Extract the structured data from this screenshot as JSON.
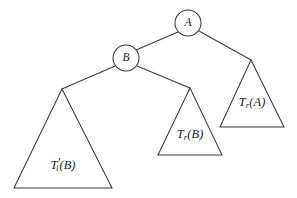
{
  "diagram": {
    "background_color": "#ffffff",
    "stroke_color": "#3a3a3a",
    "text_color": "#1c1c1c",
    "nodes": [
      {
        "id": "A",
        "label": "A",
        "cx": 188,
        "cy": 23,
        "r": 13
      },
      {
        "id": "B",
        "label": "B",
        "cx": 126,
        "cy": 58,
        "r": 13
      }
    ],
    "subtrees": [
      {
        "id": "Tl_prime_B",
        "label_main": "T",
        "label_sub": "l",
        "label_prime": "′",
        "label_arg": "(B)",
        "label_full": "T′ₗ(B)",
        "apex_x": 62,
        "apex_y": 89,
        "base_left_x": 14,
        "base_right_x": 112,
        "base_y": 188,
        "label_x": 63,
        "label_y": 166
      },
      {
        "id": "Tr_B",
        "label_main": "T",
        "label_sub": "r",
        "label_prime": "",
        "label_arg": "(B)",
        "label_full": "Tᵣ(B)",
        "apex_x": 190,
        "apex_y": 88,
        "base_left_x": 158,
        "base_right_x": 222,
        "base_y": 155,
        "label_x": 190,
        "label_y": 135
      },
      {
        "id": "Tr_A",
        "label_main": "T",
        "label_sub": "r",
        "label_prime": "",
        "label_arg": "(A)",
        "label_full": "Tᵣ(A)",
        "apex_x": 251,
        "apex_y": 60,
        "base_left_x": 220,
        "base_right_x": 284,
        "base_y": 127,
        "label_x": 252,
        "label_y": 103
      }
    ],
    "edges": [
      {
        "id": "edge-A-B",
        "from": "A",
        "to": "B",
        "x1": 178,
        "y1": 32,
        "x2": 136,
        "y2": 50
      },
      {
        "id": "edge-A-TrA",
        "from": "A",
        "to": "Tr_A",
        "x1": 199,
        "y1": 31,
        "x2": 251,
        "y2": 60
      },
      {
        "id": "edge-B-TlB",
        "from": "B",
        "to": "Tl_prime_B",
        "x1": 115,
        "y1": 66,
        "x2": 62,
        "y2": 89
      },
      {
        "id": "edge-B-TrB",
        "from": "B",
        "to": "Tr_B",
        "x1": 137,
        "y1": 66,
        "x2": 190,
        "y2": 88
      }
    ]
  }
}
